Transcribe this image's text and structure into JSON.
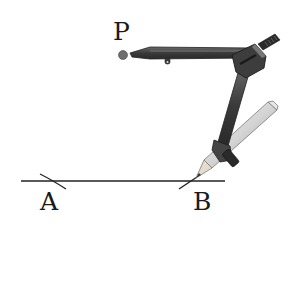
{
  "diagram": {
    "type": "geometric-construction",
    "labels": {
      "p": "P",
      "a": "A",
      "b": "B"
    },
    "colors": {
      "line": "#222222",
      "compass_dark": "#3a3a3a",
      "compass_mid": "#555555",
      "pencil_body": "#d8d8d8",
      "pencil_edge": "#8a8a8a",
      "pivot_dot": "#6e6e6e"
    }
  }
}
